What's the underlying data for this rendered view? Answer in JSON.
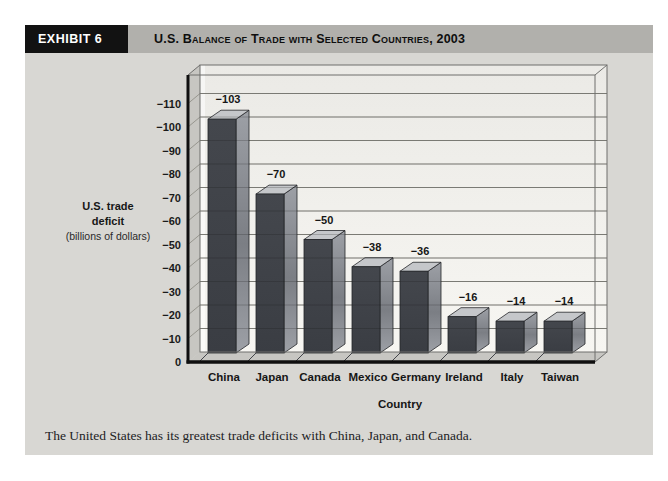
{
  "header": {
    "exhibit_label": "EXHIBIT 6",
    "title": "U.S. Balance of Trade with Selected Countries, 2003"
  },
  "caption": "The United States has its greatest trade deficits with China, Japan, and Canada.",
  "chart_data": {
    "type": "bar",
    "style": "3d-column",
    "title": "U.S. Balance of Trade with Selected Countries, 2003",
    "xlabel": "Country",
    "ylabel": "U.S. trade deficit (billions of dollars)",
    "ylabel_lines": [
      {
        "text": "U.S. trade",
        "bold": true
      },
      {
        "text": "deficit",
        "bold": true
      },
      {
        "text": "(billions of dollars)",
        "bold": false
      }
    ],
    "categories": [
      "China",
      "Japan",
      "Canada",
      "Mexico",
      "Germany",
      "Ireland",
      "Italy",
      "Taiwan"
    ],
    "values": [
      -103,
      -70,
      -50,
      -38,
      -36,
      -16,
      -14,
      -14
    ],
    "bar_labels": [
      "−103",
      "−70",
      "−50",
      "−38",
      "−36",
      "−16",
      "−14",
      "−14"
    ],
    "ytick_labels": [
      "0",
      "−10",
      "−20",
      "−30",
      "−40",
      "−50",
      "−60",
      "−70",
      "−80",
      "−90",
      "−100",
      "−110"
    ],
    "ytick_step": 10,
    "ylim": [
      0,
      -110
    ],
    "grid": true,
    "legend": false,
    "colors": {
      "panel_bg": "#d8d7d3",
      "exhibit_box_bg": "#121212",
      "header_bar_bg": "#b1b0ac",
      "bar_front": "#44474d",
      "bar_front_dark": "#3a3d43",
      "bar_side_light": "#9da0a6",
      "bar_side_dark": "#7b7e84",
      "bar_top": "#c5c7ca",
      "bar_edge": "#24262a",
      "wall": "#c7c6c2",
      "back_wall_top": "#ebeae6",
      "back_wall_bottom": "#f7f6f2",
      "gridline": "#97968f",
      "frame": "#6f6f6d",
      "axis": "#0f0f0f"
    }
  }
}
